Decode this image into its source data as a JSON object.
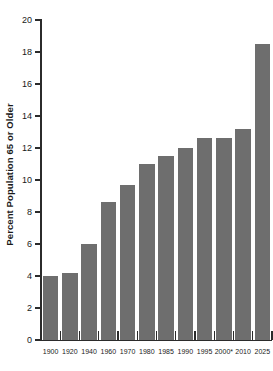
{
  "chart_data": {
    "type": "bar",
    "title": "",
    "xlabel": "",
    "ylabel": "Percent Population 65 or Older",
    "categories": [
      "1900",
      "1920",
      "1940",
      "1960",
      "1970",
      "1980",
      "1985",
      "1990",
      "1995",
      "2000*",
      "2010",
      "2025"
    ],
    "values": [
      4.0,
      4.2,
      6.0,
      8.6,
      9.7,
      11.0,
      11.5,
      12.0,
      12.6,
      12.6,
      13.2,
      18.5
    ],
    "ylim": [
      0,
      20
    ],
    "ytick_step": 2,
    "ytick_labels": [
      "0",
      "2",
      "4",
      "6",
      "8",
      "10",
      "12",
      "14",
      "16",
      "18",
      "20"
    ],
    "grid": false,
    "legend": "none",
    "bar_color": "#6e6e6e",
    "axis_color": "#2b2b2b",
    "background_color": "#ffffff"
  }
}
